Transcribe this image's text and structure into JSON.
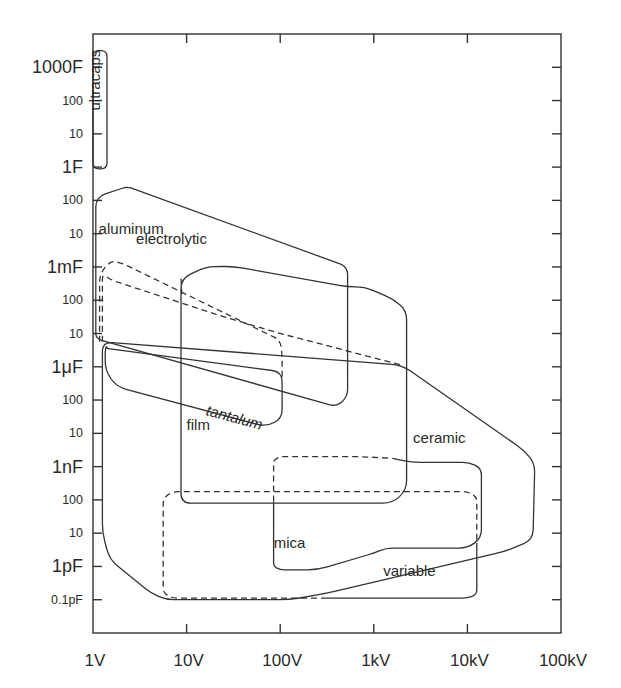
{
  "chart_data": {
    "type": "area",
    "title": "",
    "xlabel": "",
    "ylabel": "",
    "x_scale": "log",
    "y_scale": "log",
    "xlim_log10_volts": [
      0,
      5
    ],
    "ylim_log10_farads": [
      -14,
      4
    ],
    "grid": false,
    "x_ticks": [
      {
        "label": "1V",
        "log10": 0
      },
      {
        "label": "10V",
        "log10": 1
      },
      {
        "label": "100V",
        "log10": 2
      },
      {
        "label": "1kV",
        "log10": 3
      },
      {
        "label": "10kV",
        "log10": 4
      },
      {
        "label": "100kV",
        "log10": 5
      }
    ],
    "y_ticks": [
      {
        "label": "1000F",
        "log10": 3,
        "major": true
      },
      {
        "label": "100",
        "log10": 2,
        "major": false
      },
      {
        "label": "10",
        "log10": 1,
        "major": false
      },
      {
        "label": "1F",
        "log10": 0,
        "major": true
      },
      {
        "label": "100",
        "log10": -1,
        "major": false
      },
      {
        "label": "10",
        "log10": -2,
        "major": false
      },
      {
        "label": "1mF",
        "log10": -3,
        "major": true
      },
      {
        "label": "100",
        "log10": -4,
        "major": false
      },
      {
        "label": "10",
        "log10": -5,
        "major": false
      },
      {
        "label": "1μF",
        "log10": -6,
        "major": true
      },
      {
        "label": "100",
        "log10": -7,
        "major": false
      },
      {
        "label": "10",
        "log10": -8,
        "major": false
      },
      {
        "label": "1nF",
        "log10": -9,
        "major": true
      },
      {
        "label": "100",
        "log10": -10,
        "major": false
      },
      {
        "label": "10",
        "log10": -11,
        "major": false
      },
      {
        "label": "1pF",
        "log10": -12,
        "major": true
      },
      {
        "label": "0.1pF",
        "log10": -13,
        "major": false
      }
    ],
    "series": [
      {
        "name": "ultracaps",
        "style": "solid",
        "label": "ultracaps",
        "label_rotation": -90,
        "label_at": [
          0.07,
          1.7
        ],
        "outline_log10": [
          [
            0.0,
            3.5
          ],
          [
            0.15,
            3.5
          ],
          [
            0.15,
            -0.05
          ],
          [
            0.0,
            -0.05
          ]
        ],
        "rounded": true
      },
      {
        "name": "aluminum electrolytic",
        "style": "solid",
        "label": "aluminum",
        "label2": "electrolytic",
        "label_at": [
          0.06,
          -2.0
        ],
        "label2_at": [
          0.46,
          -2.3
        ],
        "outline_log10": [
          [
            0.33,
            -0.62
          ],
          [
            0.38,
            -0.6
          ],
          [
            2.68,
            -2.95
          ],
          [
            2.72,
            -3.12
          ],
          [
            2.72,
            -6.9
          ],
          [
            2.6,
            -7.2
          ],
          [
            0.08,
            -5.2
          ],
          [
            0.03,
            -5.1
          ],
          [
            0.03,
            -0.9
          ]
        ]
      },
      {
        "name": "tantalum",
        "style": "solid",
        "label": "tantalum",
        "label_rotation": 15,
        "label_at": [
          1.2,
          -7.45
        ],
        "outline_log10": [
          [
            0.13,
            -5.55
          ],
          [
            0.14,
            -5.38
          ],
          [
            0.15,
            -5.45
          ],
          [
            2.02,
            -6.15
          ],
          [
            2.02,
            -7.55
          ],
          [
            1.85,
            -7.8
          ],
          [
            0.25,
            -6.6
          ],
          [
            0.13,
            -6.1
          ]
        ]
      },
      {
        "name": "tantalum (dashed extension)",
        "style": "dashed",
        "outline_log10": [
          [
            0.07,
            -5.25
          ],
          [
            0.07,
            -3.2
          ],
          [
            0.2,
            -2.8
          ],
          [
            0.32,
            -2.9
          ],
          [
            2.0,
            -5.2
          ],
          [
            2.02,
            -5.6
          ],
          [
            2.02,
            -6.35
          ]
        ]
      },
      {
        "name": "film",
        "style": "solid",
        "label": "film",
        "label_at": [
          1.0,
          -7.9
        ],
        "outline_log10": [
          [
            0.94,
            -10.1
          ],
          [
            0.94,
            -3.35
          ],
          [
            1.2,
            -3.0
          ],
          [
            1.5,
            -2.98
          ],
          [
            2.72,
            -3.6
          ],
          [
            2.9,
            -3.6
          ],
          [
            3.2,
            -3.95
          ],
          [
            3.35,
            -4.3
          ],
          [
            3.35,
            -9.7
          ],
          [
            3.2,
            -10.1
          ]
        ]
      },
      {
        "name": "film (dashed)",
        "style": "dashed",
        "outline_log10": [
          [
            0.94,
            -3.35
          ],
          [
            0.95,
            -3.85
          ]
        ]
      },
      {
        "name": "ceramic",
        "style": "solid",
        "label": "ceramic",
        "label_at": [
          3.42,
          -8.3
        ],
        "outline_log10": [
          [
            0.1,
            -5.25
          ],
          [
            0.1,
            -11.0
          ],
          [
            0.18,
            -11.8
          ],
          [
            0.62,
            -12.8
          ],
          [
            0.78,
            -13.0
          ],
          [
            2.1,
            -13.0
          ],
          [
            2.5,
            -12.8
          ],
          [
            4.4,
            -11.55
          ],
          [
            4.7,
            -11.2
          ],
          [
            4.72,
            -8.9
          ],
          [
            4.6,
            -8.5
          ],
          [
            3.3,
            -5.95
          ]
        ]
      },
      {
        "name": "ceramic (dashed)",
        "style": "dashed",
        "outline_log10": [
          [
            0.1,
            -5.25
          ],
          [
            0.1,
            -3.2
          ],
          [
            0.2,
            -3.4
          ],
          [
            1.4,
            -4.5
          ],
          [
            2.0,
            -5.0
          ],
          [
            3.3,
            -5.95
          ]
        ]
      },
      {
        "name": "mica",
        "style": "solid",
        "label": "mica",
        "label_at": [
          1.93,
          -11.45
        ],
        "outline_log10": [
          [
            1.93,
            -10.05
          ],
          [
            1.93,
            -12.0
          ],
          [
            2.0,
            -12.1
          ],
          [
            2.4,
            -12.1
          ],
          [
            3.0,
            -11.6
          ],
          [
            3.13,
            -11.45
          ],
          [
            4.0,
            -11.45
          ],
          [
            4.15,
            -11.15
          ],
          [
            4.15,
            -9.05
          ],
          [
            4.02,
            -8.87
          ],
          [
            3.4,
            -8.87
          ],
          [
            3.2,
            -8.75
          ]
        ]
      },
      {
        "name": "mica (dashed)",
        "style": "dashed",
        "outline_log10": [
          [
            1.93,
            -10.05
          ],
          [
            1.93,
            -8.8
          ],
          [
            2.0,
            -8.7
          ],
          [
            2.85,
            -8.7
          ],
          [
            3.2,
            -8.75
          ]
        ]
      },
      {
        "name": "variable",
        "style": "solid",
        "label": "variable",
        "label_at": [
          3.1,
          -12.3
        ],
        "outline_log10": [
          [
            2.5,
            -12.95
          ],
          [
            4.0,
            -12.95
          ],
          [
            4.1,
            -12.85
          ],
          [
            4.1,
            -11.3
          ]
        ]
      },
      {
        "name": "variable (dashed)",
        "style": "dashed",
        "outline_log10": [
          [
            2.5,
            -12.95
          ],
          [
            0.85,
            -12.95
          ],
          [
            0.75,
            -12.8
          ],
          [
            0.75,
            -9.95
          ],
          [
            0.85,
            -9.75
          ],
          [
            4.0,
            -9.75
          ],
          [
            4.1,
            -9.9
          ],
          [
            4.1,
            -11.3
          ]
        ]
      }
    ]
  }
}
